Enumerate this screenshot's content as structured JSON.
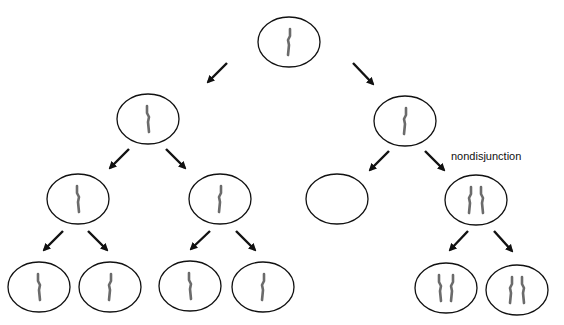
{
  "diagram": {
    "type": "meiosis-nondisjunction",
    "annotation": "nondisjunction",
    "colors": {
      "cell_outline": "#111111",
      "chromosome": "#6b6b6b",
      "arrow": "#111111",
      "background": "#ffffff"
    },
    "cells": [
      {
        "id": "root",
        "level": 0,
        "cx": 289,
        "cy": 42,
        "chromosomes": 1
      },
      {
        "id": "l1-left",
        "level": 1,
        "cx": 148,
        "cy": 119,
        "chromosomes": 1
      },
      {
        "id": "l1-right",
        "level": 1,
        "cx": 405,
        "cy": 121,
        "chromosomes": 1
      },
      {
        "id": "l2-a",
        "level": 2,
        "cx": 78,
        "cy": 199,
        "chromosomes": 1
      },
      {
        "id": "l2-b",
        "level": 2,
        "cx": 220,
        "cy": 199,
        "chromosomes": 1
      },
      {
        "id": "l2-c",
        "level": 2,
        "cx": 337,
        "cy": 199,
        "chromosomes": 0
      },
      {
        "id": "l2-d",
        "level": 2,
        "cx": 476,
        "cy": 200,
        "chromosomes": 2
      },
      {
        "id": "l3-a",
        "level": 3,
        "cx": 39,
        "cy": 287,
        "chromosomes": 1
      },
      {
        "id": "l3-b",
        "level": 3,
        "cx": 110,
        "cy": 287,
        "chromosomes": 1
      },
      {
        "id": "l3-c",
        "level": 3,
        "cx": 190,
        "cy": 286,
        "chromosomes": 1
      },
      {
        "id": "l3-d",
        "level": 3,
        "cx": 263,
        "cy": 287,
        "chromosomes": 1
      },
      {
        "id": "l3-e",
        "level": 3,
        "cx": 446,
        "cy": 288,
        "chromosomes": 2
      },
      {
        "id": "l3-f",
        "level": 3,
        "cx": 517,
        "cy": 290,
        "chromosomes": 2
      }
    ],
    "arrows": [
      {
        "x1": 227,
        "y1": 63,
        "x2": 208,
        "y2": 82
      },
      {
        "x1": 353,
        "y1": 63,
        "x2": 373,
        "y2": 84
      },
      {
        "x1": 129,
        "y1": 149,
        "x2": 110,
        "y2": 168
      },
      {
        "x1": 166,
        "y1": 149,
        "x2": 185,
        "y2": 168
      },
      {
        "x1": 389,
        "y1": 151,
        "x2": 370,
        "y2": 170
      },
      {
        "x1": 425,
        "y1": 151,
        "x2": 444,
        "y2": 170
      },
      {
        "x1": 63,
        "y1": 231,
        "x2": 44,
        "y2": 250
      },
      {
        "x1": 88,
        "y1": 231,
        "x2": 107,
        "y2": 250
      },
      {
        "x1": 210,
        "y1": 231,
        "x2": 191,
        "y2": 249
      },
      {
        "x1": 236,
        "y1": 231,
        "x2": 255,
        "y2": 250
      },
      {
        "x1": 468,
        "y1": 231,
        "x2": 450,
        "y2": 250
      },
      {
        "x1": 494,
        "y1": 231,
        "x2": 512,
        "y2": 251
      }
    ]
  }
}
